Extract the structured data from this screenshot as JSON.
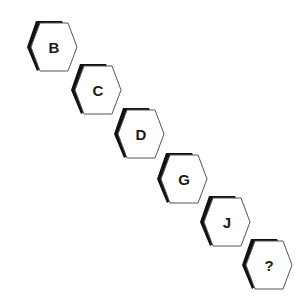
{
  "puzzle": {
    "type": "letter-sequence",
    "items": [
      {
        "label": "B",
        "x": 24,
        "y": 20
      },
      {
        "label": "C",
        "x": 68,
        "y": 63
      },
      {
        "label": "D",
        "x": 111,
        "y": 107
      },
      {
        "label": "G",
        "x": 154,
        "y": 152
      },
      {
        "label": "J",
        "x": 197,
        "y": 195
      },
      {
        "label": "?",
        "x": 239,
        "y": 238
      }
    ]
  },
  "colors": {
    "background": "#ffffff",
    "outline": "#555555",
    "shadow": "#111111",
    "text": "#1a1a1a"
  }
}
